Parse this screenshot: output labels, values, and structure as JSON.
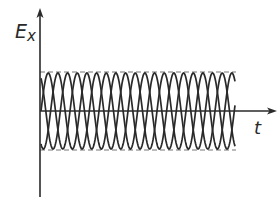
{
  "diagram": {
    "title": "",
    "y_axis": {
      "label_main": "E",
      "label_sub": "x"
    },
    "x_axis": {
      "label": "t"
    },
    "envelope": {
      "upper": "dashed amplitude bound",
      "lower": "dashed amplitude bound"
    },
    "waves": [
      {
        "name": "wave-1",
        "phase": 0.0
      },
      {
        "name": "wave-2",
        "phase": 2.1
      },
      {
        "name": "wave-3",
        "phase": 4.2
      }
    ],
    "colors": {
      "line": "#2a2a2a",
      "dash": "#777777"
    }
  }
}
